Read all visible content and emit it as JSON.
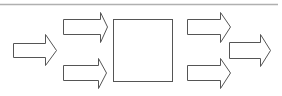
{
  "diagram": {
    "width": 282,
    "height": 96,
    "background": "#ffffff",
    "stroke_color": "#555555",
    "fill_color": "#ffffff",
    "top_rule": {
      "x1": 0,
      "x2": 278,
      "y": 4,
      "color": "#b0b0b0"
    },
    "center_box": {
      "x": 113,
      "y": 19,
      "width": 59,
      "height": 62
    },
    "arrows": [
      {
        "id": "input-main",
        "body_x1": 13,
        "body_x2": 45,
        "body_y1": 43,
        "body_y2": 57,
        "head_y1": 34,
        "head_y2": 65,
        "tip_x": 56
      },
      {
        "id": "input-upper",
        "body_x1": 63,
        "body_x2": 100,
        "body_y1": 19,
        "body_y2": 34,
        "head_y1": 12,
        "head_y2": 42,
        "tip_x": 107
      },
      {
        "id": "input-lower",
        "body_x1": 63,
        "body_x2": 98,
        "body_y1": 65,
        "body_y2": 80,
        "head_y1": 58,
        "head_y2": 88,
        "tip_x": 106
      },
      {
        "id": "output-upper",
        "body_x1": 187,
        "body_x2": 220,
        "body_y1": 19,
        "body_y2": 34,
        "head_y1": 12,
        "head_y2": 42,
        "tip_x": 230
      },
      {
        "id": "output-lower",
        "body_x1": 187,
        "body_x2": 220,
        "body_y1": 65,
        "body_y2": 80,
        "head_y1": 58,
        "head_y2": 88,
        "tip_x": 230
      },
      {
        "id": "output-main",
        "body_x1": 229,
        "body_x2": 260,
        "body_y1": 42,
        "body_y2": 58,
        "head_y1": 34,
        "head_y2": 66,
        "tip_x": 270
      }
    ]
  }
}
